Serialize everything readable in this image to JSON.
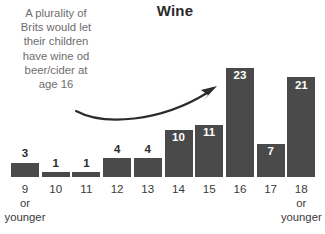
{
  "chart_data": {
    "type": "bar",
    "title": "Wine",
    "xlabel": "",
    "ylabel": "",
    "grid": false,
    "legend": null,
    "ylim": [
      0,
      23
    ],
    "categories": [
      "9 or younger",
      "10",
      "11",
      "12",
      "13",
      "14",
      "15",
      "16",
      "17",
      "18 or younger"
    ],
    "tick_labels": [
      {
        "main": "9",
        "line2": "or",
        "line3": "younger"
      },
      {
        "main": "10",
        "line2": "",
        "line3": ""
      },
      {
        "main": "11",
        "line2": "",
        "line3": ""
      },
      {
        "main": "12",
        "line2": "",
        "line3": ""
      },
      {
        "main": "13",
        "line2": "",
        "line3": ""
      },
      {
        "main": "14",
        "line2": "",
        "line3": ""
      },
      {
        "main": "15",
        "line2": "",
        "line3": ""
      },
      {
        "main": "16",
        "line2": "",
        "line3": ""
      },
      {
        "main": "17",
        "line2": "",
        "line3": ""
      },
      {
        "main": "18",
        "line2": "or",
        "line3": "younger"
      }
    ],
    "values": [
      3,
      1,
      1,
      4,
      4,
      10,
      11,
      23,
      7,
      21
    ],
    "value_labels": [
      "3",
      "1",
      "1",
      "4",
      "4",
      "10",
      "11",
      "23",
      "7",
      "21"
    ],
    "label_placement": [
      "outside",
      "outside",
      "outside",
      "outside",
      "outside",
      "inside",
      "inside",
      "inside",
      "inside",
      "inside"
    ],
    "bar_color": "#4a4a4a",
    "annotation": {
      "lines": [
        "A plurality of",
        "Brits would let",
        "their children",
        "have wine od",
        "beer/cider at",
        "age 16"
      ],
      "color": "#6d6d6d",
      "arrow": "curved-arrow-pointing-right"
    }
  },
  "colors": {
    "background": "#ffffff",
    "bar": "#4a4a4a",
    "title": "#2b2b2b",
    "tick": "#3a3a3a",
    "annotation": "#6d6d6d",
    "value_inside": "#ffffff",
    "value_outside": "#2b2b2b"
  }
}
